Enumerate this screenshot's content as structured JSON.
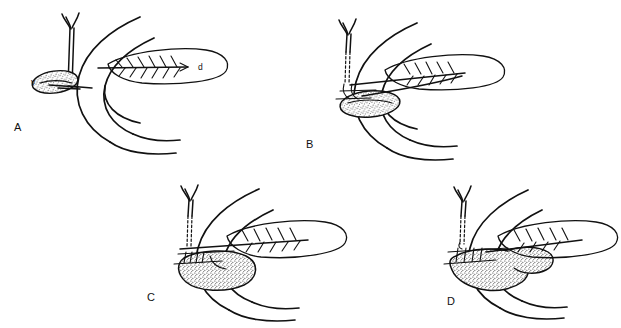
{
  "figure": {
    "background_color": "#ffffff",
    "ink_color": "#111111",
    "width": 621,
    "height": 328,
    "style": "black-and-white line drawing, stippled shading"
  },
  "panels": [
    {
      "id": "A",
      "letter": "A",
      "letter_x": 14,
      "letter_y": 131,
      "description": "Baseline anatomy: duodenal C-loop with bile duct entering, gallbladder at left, pancreas at right",
      "labels": [
        {
          "key": "v",
          "text": "v",
          "x": 31,
          "y": 85,
          "meaning": "gallbladder"
        },
        {
          "key": "d",
          "text": "d",
          "x": 198,
          "y": 68,
          "meaning": "pancreatic duct"
        }
      ]
    },
    {
      "id": "B",
      "letter": "B",
      "letter_x": 306,
      "letter_y": 148,
      "description": "Duct dissected free, shown dashed behind duodenum; stippled structure displaced inferiorly",
      "labels": []
    },
    {
      "id": "C",
      "letter": "C",
      "letter_x": 147,
      "letter_y": 301,
      "description": "Anastomosis begun, stippled mass enlarged beneath duodenal wall",
      "labels": []
    },
    {
      "id": "D",
      "letter": "D",
      "letter_x": 447,
      "letter_y": 305,
      "description": "Completed reconstruction with stippled mass fully formed and duct re-implanted",
      "labels": []
    }
  ],
  "legend_keys": [
    {
      "symbol": "v",
      "meaning": "gallbladder"
    },
    {
      "symbol": "d",
      "meaning": "pancreatic duct"
    }
  ]
}
